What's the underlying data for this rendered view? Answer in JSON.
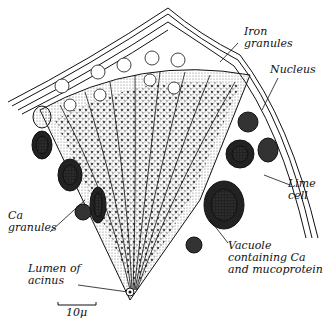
{
  "figure": {
    "type": "biological illustration",
    "colors": {
      "ink": "#111111",
      "paper": "#ffffff"
    }
  },
  "labels": {
    "iron_granules": "Iron\ngranules",
    "nucleus": "Nucleus",
    "lime_cell": "Lime\ncell",
    "vacuole": "Vacuole\ncontaining Ca\nand mucoprotein",
    "ca_granules": "Ca\ngranules",
    "lumen": "Lumen of\nacinus",
    "scale_bar": "10μ"
  }
}
